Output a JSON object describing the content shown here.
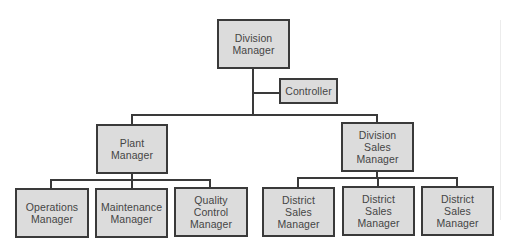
{
  "chart": {
    "root": {
      "label": "Division\nManager"
    },
    "staff": {
      "label": "Controller"
    },
    "plant": {
      "label": "Plant\nManager",
      "reports": [
        {
          "label": "Operations\nManager"
        },
        {
          "label": "Maintenance\nManager"
        },
        {
          "label": "Quality\nControl\nManager"
        }
      ]
    },
    "sales": {
      "label": "Division\nSales\nManager",
      "reports": [
        {
          "label": "District\nSales\nManager"
        },
        {
          "label": "District\nSales\nManager"
        },
        {
          "label": "District\nSales\nManager"
        }
      ]
    }
  },
  "colors": {
    "box_fill": "#dcdcdc",
    "border": "#3a3a3a",
    "text": "#454545"
  }
}
